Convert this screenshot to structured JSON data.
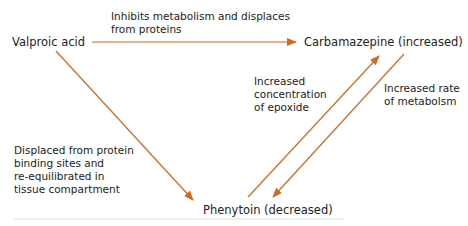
{
  "diagram": {
    "accent_color": "#d2691e",
    "nodes": {
      "valproic": "Valproic acid",
      "carbamazepine": "Carbamazepine (increased)",
      "phenytoin": "Phenytoin (decreased)"
    },
    "edges": {
      "valproic_to_carbamazepine": [
        "Inhibits metabolism and displaces",
        "from proteins"
      ],
      "valproic_to_phenytoin": [
        "Displaced from protein",
        "binding sites and",
        "re-equilibrated in",
        "tissue compartment"
      ],
      "phenytoin_to_carbamazepine": [
        "Increased",
        "concentration",
        "of epoxide"
      ],
      "carbamazepine_to_phenytoin": [
        "Increased rate",
        "of metabolsm"
      ]
    }
  }
}
